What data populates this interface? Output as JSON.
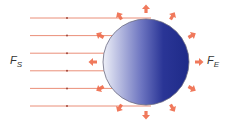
{
  "diagram": {
    "labels": {
      "solar_flux": {
        "main": "F",
        "sub": "S"
      },
      "earth_flux": {
        "main": "F",
        "sub": "E"
      }
    },
    "incoming_ray_count": 6,
    "outgoing_arrow_count": 12,
    "colors": {
      "ray": "#e8826a",
      "ray_dot": "#a0473a",
      "arrow": "#ee6a4a",
      "sphere_light": "#e6e8f5",
      "sphere_dark": "#1e2a8c",
      "sphere_outline": "#6a6a80"
    }
  }
}
